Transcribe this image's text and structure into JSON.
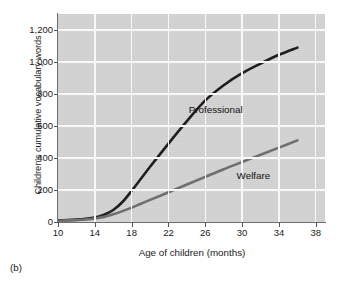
{
  "caption": "(b)",
  "chart_data": {
    "type": "line",
    "title": "",
    "xlabel": "Age of children (months)",
    "ylabel": "Children's cumulative vocabulary words",
    "xlim": [
      10,
      39
    ],
    "ylim": [
      0,
      1300
    ],
    "x_ticks": [
      10,
      14,
      18,
      22,
      26,
      30,
      34,
      38
    ],
    "x_tick_labels": [
      "10",
      "14",
      "18",
      "22",
      "26",
      "30",
      "34",
      "38"
    ],
    "y_ticks": [
      0,
      200,
      400,
      600,
      800,
      1000,
      1200
    ],
    "y_tick_labels": [
      "0",
      "200",
      "400",
      "600",
      "800",
      "1,000",
      "1,200"
    ],
    "grid": true,
    "grid_color": "#fbfbfb",
    "plot_background": "#d3d3d3",
    "legend": "inline-annotations",
    "series": [
      {
        "name": "Professional",
        "color": "#1b1b1b",
        "label_x": 24.2,
        "label_y": 700,
        "x": [
          10,
          11,
          12,
          13,
          14,
          15,
          16,
          17,
          18,
          19,
          20,
          22,
          24,
          26,
          28,
          30,
          32,
          34,
          36
        ],
        "values": [
          10,
          12,
          15,
          20,
          28,
          45,
          75,
          125,
          195,
          270,
          345,
          490,
          630,
          760,
          855,
          930,
          990,
          1045,
          1090
        ]
      },
      {
        "name": "Welfare",
        "color": "#6d6d6d",
        "label_x": 29.4,
        "label_y": 290,
        "x": [
          10,
          11,
          12,
          13,
          14,
          15,
          16,
          17,
          18,
          19,
          20,
          22,
          24,
          26,
          28,
          30,
          32,
          34,
          36
        ],
        "values": [
          8,
          10,
          12,
          16,
          22,
          32,
          48,
          68,
          90,
          114,
          138,
          186,
          234,
          282,
          330,
          375,
          420,
          465,
          510
        ]
      }
    ]
  }
}
